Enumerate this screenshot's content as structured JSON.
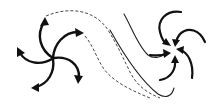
{
  "diagram": {
    "type": "flow-schematic",
    "colors": {
      "stroke": "#111111",
      "background": "#ffffff"
    },
    "nodes": [
      {
        "id": "left-vortex",
        "kind": "diverging-spiral",
        "arms": 5,
        "arrow_direction": "outward",
        "center": [
          53,
          59
        ]
      },
      {
        "id": "right-vortex",
        "kind": "converging-spiral",
        "arms": 5,
        "arrow_direction": "inward",
        "center": [
          173,
          50
        ]
      }
    ],
    "edges": [
      {
        "from": "left-vortex",
        "to": "right-vortex",
        "style": "dashed",
        "shape": "s-curve"
      },
      {
        "from": "left-vortex",
        "to": "right-vortex",
        "style": "solid-thin",
        "shape": "s-curve"
      },
      {
        "from": "left-vortex",
        "to": "right-vortex",
        "style": "solid-thin",
        "shape": "s-curve"
      }
    ]
  }
}
